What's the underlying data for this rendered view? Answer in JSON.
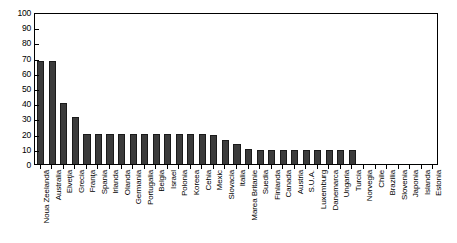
{
  "chart_data": {
    "type": "bar",
    "title": "",
    "subtitle": "",
    "xlabel": "",
    "ylabel": "",
    "ylim": [
      0,
      100
    ],
    "xlim": [
      0,
      33
    ],
    "grid": false,
    "legend": null,
    "legend_position": "none",
    "y_ticks": [
      0,
      10,
      20,
      30,
      40,
      50,
      60,
      70,
      80,
      90,
      100
    ],
    "y_tick_labels": [
      "0",
      "10",
      "20",
      "30",
      "40",
      "50",
      "60",
      "70",
      "80",
      "90",
      "100"
    ],
    "bar_color": "#3b3b3b",
    "bar_edge_color": "#1a1a1a",
    "categories": [
      "Noua Zeelandă",
      "Australia",
      "Elveţia",
      "Grecia",
      "Franţa",
      "Spania",
      "Irlanda",
      "Olanda",
      "Germania",
      "Portugalia",
      "Belgia",
      "Israel",
      "Polonia",
      "Koreea",
      "Cehia",
      "Mexic",
      "Slovacia",
      "Italia",
      "Marea Britanie",
      "Suedia",
      "Finlanda",
      "Canada",
      "Austria",
      "S.U.A.",
      "Luxemburg",
      "Danemarca",
      "Ungaria",
      "Turcia",
      "Norvegia",
      "Chile",
      "Brazilia",
      "Slovenia",
      "Japonia",
      "Islanda",
      "Estonia"
    ],
    "values": [
      68,
      68,
      40,
      31,
      20,
      20,
      20,
      20,
      20,
      20,
      20,
      20,
      20,
      20,
      20,
      19,
      16,
      13,
      10,
      9,
      9,
      9,
      9,
      9,
      9,
      9,
      9,
      9,
      0,
      0,
      0,
      0,
      0,
      0,
      0
    ]
  }
}
